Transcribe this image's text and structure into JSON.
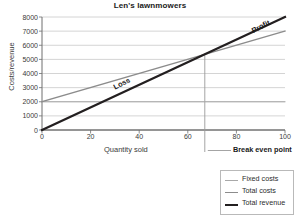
{
  "chart_data": {
    "type": "line",
    "title": "Len's lawnmowers",
    "xlabel": "Quantity sold",
    "ylabel": "Costs/revenue",
    "xlim": [
      0,
      100
    ],
    "ylim": [
      0,
      8000
    ],
    "grid": true,
    "legend_position": "bottom-right",
    "x_ticks": [
      "0",
      "20",
      "40",
      "60",
      "80",
      "100"
    ],
    "y_ticks": [
      "0",
      "1000",
      "2000",
      "3000",
      "4000",
      "5000",
      "6000",
      "7000",
      "8000"
    ],
    "series": [
      {
        "name": "Fixed costs",
        "color": "#a8a8a8",
        "width": 1,
        "x": [
          0,
          100
        ],
        "values": [
          2000,
          2000
        ]
      },
      {
        "name": "Total costs",
        "color": "#8c8c8c",
        "width": 1.4,
        "x": [
          0,
          100
        ],
        "values": [
          2000,
          7000
        ]
      },
      {
        "name": "Total revenue",
        "color": "#231f20",
        "width": 2.2,
        "x": [
          0,
          100
        ],
        "values": [
          0,
          8000
        ]
      }
    ],
    "annotations": [
      {
        "text": "Loss",
        "x": 33,
        "y": 3000,
        "rotation": -27
      },
      {
        "text": "Profit",
        "x": 90,
        "y": 7150,
        "rotation": -27
      },
      {
        "text": "Break even point",
        "x": 67,
        "y": 5400,
        "bold": true
      }
    ],
    "markers": [
      {
        "name": "break-even-point",
        "x": 67,
        "y": 5400
      }
    ]
  },
  "legend": {
    "items": [
      {
        "label": "Fixed costs"
      },
      {
        "label": "Total costs"
      },
      {
        "label": "Total revenue"
      }
    ]
  },
  "colors": {
    "fixed_costs": "#a8a8a8",
    "total_costs": "#8c8c8c",
    "total_revenue": "#231f20",
    "grid": "#c9c9c9",
    "axis": "#6e6e6e"
  }
}
